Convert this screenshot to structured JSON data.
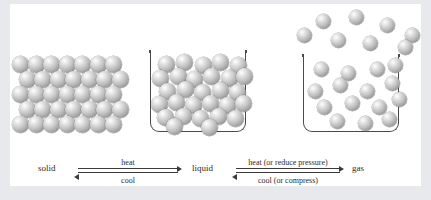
{
  "figure": {
    "background_color": "#eef0f2",
    "card_color": "#ffffff",
    "particle_color": "#bdbdbd",
    "outline_color": "#4a4a4a"
  },
  "states": [
    {
      "id": "solid",
      "label": "solid",
      "particles": 35,
      "arrangement": "ordered close-packed lattice, 5 rows of 7"
    },
    {
      "id": "liquid",
      "label": "liquid",
      "particles": 29,
      "arrangement": "disordered close-packed inside open container"
    },
    {
      "id": "gas",
      "label": "gas",
      "particles": 23,
      "arrangement": "widely spaced, some escaping above the open container"
    }
  ],
  "transitions": [
    {
      "id": "solid-liquid",
      "from": "solid",
      "to": "liquid",
      "forward_label": "heat",
      "reverse_label": "cool"
    },
    {
      "id": "liquid-gas",
      "from": "liquid",
      "to": "gas",
      "forward_label": "heat (or reduce pressure)",
      "reverse_label": "cool (or compress)"
    }
  ],
  "solid_lattice": {
    "rows": [
      {
        "offset": 0,
        "count": 7
      },
      {
        "offset": 6.5,
        "count": 7
      },
      {
        "offset": 0,
        "count": 7
      },
      {
        "offset": 6.5,
        "count": 7
      },
      {
        "offset": 0,
        "count": 7
      }
    ],
    "origin_x": 12,
    "origin_y": 56,
    "step_x": 15.5,
    "step_y": 15,
    "diameter": 17
  },
  "liquid_container": {
    "x": 150,
    "y": 52,
    "width": 96,
    "height": 80
  },
  "liquid_particles": [
    {
      "x": 158,
      "y": 56
    },
    {
      "x": 176,
      "y": 54
    },
    {
      "x": 195,
      "y": 57
    },
    {
      "x": 212,
      "y": 54
    },
    {
      "x": 230,
      "y": 57
    },
    {
      "x": 152,
      "y": 70
    },
    {
      "x": 170,
      "y": 68
    },
    {
      "x": 186,
      "y": 71
    },
    {
      "x": 203,
      "y": 68
    },
    {
      "x": 221,
      "y": 70
    },
    {
      "x": 236,
      "y": 68
    },
    {
      "x": 159,
      "y": 83
    },
    {
      "x": 177,
      "y": 81
    },
    {
      "x": 194,
      "y": 84
    },
    {
      "x": 212,
      "y": 82
    },
    {
      "x": 229,
      "y": 84
    },
    {
      "x": 151,
      "y": 96
    },
    {
      "x": 168,
      "y": 94
    },
    {
      "x": 185,
      "y": 97
    },
    {
      "x": 202,
      "y": 95
    },
    {
      "x": 219,
      "y": 97
    },
    {
      "x": 235,
      "y": 95
    },
    {
      "x": 157,
      "y": 109
    },
    {
      "x": 175,
      "y": 108
    },
    {
      "x": 192,
      "y": 110
    },
    {
      "x": 210,
      "y": 108
    },
    {
      "x": 227,
      "y": 110
    },
    {
      "x": 166,
      "y": 118
    },
    {
      "x": 201,
      "y": 119
    }
  ],
  "gas_container": {
    "x": 303,
    "y": 56,
    "width": 96,
    "height": 76
  },
  "gas_particles_inside": [
    {
      "x": 314,
      "y": 62
    },
    {
      "x": 341,
      "y": 66
    },
    {
      "x": 370,
      "y": 62
    },
    {
      "x": 388,
      "y": 58
    },
    {
      "x": 308,
      "y": 84
    },
    {
      "x": 333,
      "y": 78
    },
    {
      "x": 360,
      "y": 84
    },
    {
      "x": 385,
      "y": 76
    },
    {
      "x": 317,
      "y": 100
    },
    {
      "x": 345,
      "y": 96
    },
    {
      "x": 372,
      "y": 100
    },
    {
      "x": 392,
      "y": 92
    },
    {
      "x": 330,
      "y": 114
    },
    {
      "x": 358,
      "y": 116
    },
    {
      "x": 382,
      "y": 112
    }
  ],
  "gas_particles_escaped": [
    {
      "x": 316,
      "y": 14
    },
    {
      "x": 349,
      "y": 10
    },
    {
      "x": 380,
      "y": 18
    },
    {
      "x": 405,
      "y": 28
    },
    {
      "x": 297,
      "y": 28
    },
    {
      "x": 331,
      "y": 33
    },
    {
      "x": 363,
      "y": 36
    },
    {
      "x": 398,
      "y": 40
    }
  ],
  "state_label_positions": {
    "solid": {
      "x": 38,
      "y": 163
    },
    "liquid": {
      "x": 192,
      "y": 163
    },
    "gas": {
      "x": 352,
      "y": 163
    }
  },
  "arrow_positions": {
    "solid-liquid": {
      "x": 78,
      "y": 168,
      "width": 100
    },
    "liquid-gas": {
      "x": 236,
      "y": 168,
      "width": 104
    }
  }
}
